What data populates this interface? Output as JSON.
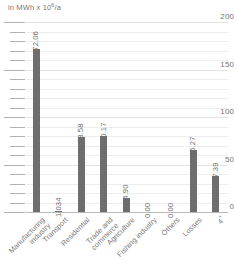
{
  "chart_data": {
    "type": "bar",
    "title": "",
    "subtitle": "",
    "unit_caption_prefix": "in MWh x 10",
    "unit_caption_exponent": "6",
    "unit_caption_suffix": "/a",
    "xlabel": "",
    "ylabel": "in MWh x 10^6/a",
    "ylim": [
      0,
      200
    ],
    "ytick_step": 50,
    "minor_gridline_step": 10,
    "grid": true,
    "legend": "none",
    "bar_color": "#6e6e6e",
    "gridline_color": "#ededed",
    "axis_color": "#b9b9b9",
    "text_color": "#6d6d6d",
    "background": "#ffffff",
    "ytick_labels": [
      "0",
      "50",
      "100",
      "150",
      "200"
    ],
    "ytick_values": [
      0,
      50,
      100,
      150,
      200
    ],
    "categories": [
      "Manufacturing industry",
      "Transport",
      "Residential",
      "Trade and commerce",
      "Agriculture",
      "Fishing industry",
      "Others",
      "Losses",
      "4*"
    ],
    "category_lines": [
      [
        "Manufacturing",
        "industry"
      ],
      [
        "Transport"
      ],
      [
        "Residential"
      ],
      [
        "Trade and",
        "commerce"
      ],
      [
        "Agriculture"
      ],
      [
        "Fishing industry"
      ],
      [
        "Others"
      ],
      [
        "Losses"
      ],
      [
        "4*"
      ]
    ],
    "values": [
      172.06,
      1.034,
      78.58,
      80.17,
      14.9,
      0.0,
      0.0,
      65.27,
      37.39
    ],
    "value_labels": [
      "172.06",
      "1.034",
      "78.58",
      "80.17",
      "14.90",
      "0.00",
      "0.00",
      "65.27",
      "37.39"
    ]
  }
}
